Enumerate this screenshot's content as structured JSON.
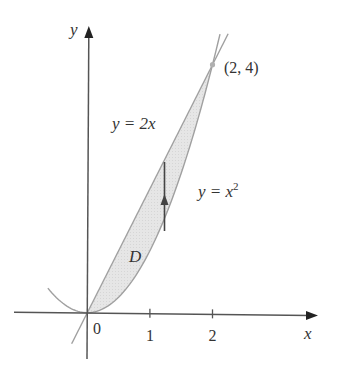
{
  "figure": {
    "type": "region-between-curves",
    "width": 341,
    "height": 381,
    "colors": {
      "background": "#ffffff",
      "region_fill": "#e4e4e4",
      "curve_stroke": "#a0a0a0",
      "axis_stroke": "#555555",
      "arrow_stroke": "#444444",
      "text": "#333333",
      "point": "#b0b0b0"
    },
    "mapping": {
      "origin_px": [
        87.3,
        312.7
      ],
      "unit_x_px": 62.6,
      "unit_y_px": 62.0
    },
    "axes": {
      "x": {
        "label": "x",
        "from_px": [
          14,
          312.2
        ],
        "to_px": [
          318,
          315.5
        ],
        "ticks": [
          {
            "value": 1,
            "label": "1"
          },
          {
            "value": 2,
            "label": "2"
          }
        ],
        "origin_label": "0"
      },
      "y": {
        "label": "y",
        "from_px": [
          87.0,
          359
        ],
        "to_px": [
          88.8,
          26
        ]
      }
    },
    "curves": [
      {
        "id": "line",
        "equation_label": "y = 2x",
        "expr": "2x",
        "x_range": [
          -0.25,
          2.25
        ]
      },
      {
        "id": "parabola",
        "equation_label": "y = x",
        "superscript": "2",
        "expr": "x^2",
        "x_range": [
          -0.63,
          2.12
        ]
      }
    ],
    "region": {
      "label": "D",
      "x_range": [
        0,
        2
      ],
      "upper": "2x",
      "lower": "x^2"
    },
    "intersection_point": {
      "x": 2,
      "y": 4,
      "label": "(2, 4)"
    },
    "vertical_arrow": {
      "x_px": 164.5,
      "from_y_px": 231,
      "to_y_px": 162,
      "head_y_px": 197
    },
    "labels": {
      "line_label_pos": [
        112,
        129
      ],
      "parabola_label_pos": [
        198,
        197
      ],
      "region_label_pos": [
        129,
        262
      ],
      "point_label_pos": [
        224,
        73
      ],
      "origin_label_pos": [
        93,
        334
      ],
      "x_axis_label_pos": [
        304,
        339
      ],
      "y_axis_label_pos": [
        70,
        35
      ]
    }
  }
}
